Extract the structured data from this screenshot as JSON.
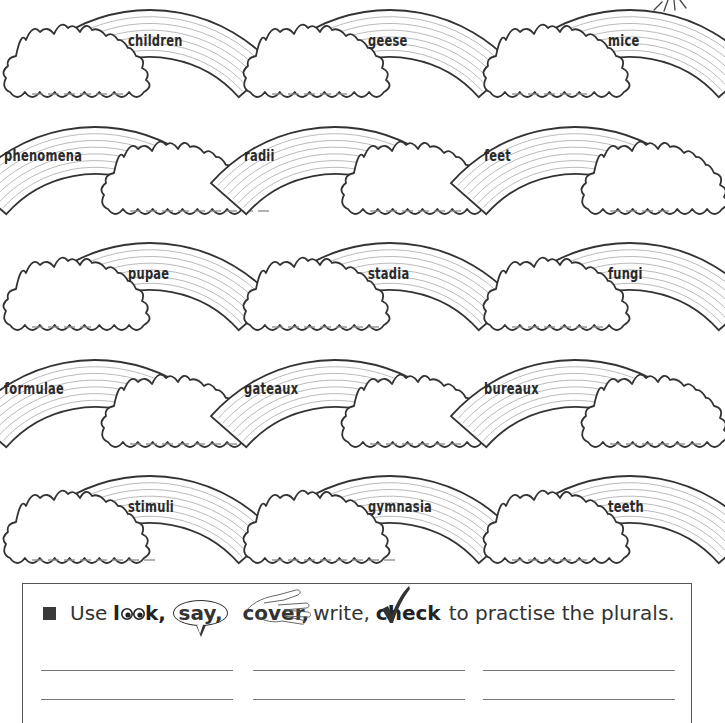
{
  "worksheet": {
    "plurals": [
      {
        "word": "children",
        "row": 0,
        "col": 0,
        "orientation": "cloud-left",
        "blanks": 6
      },
      {
        "word": "geese",
        "row": 0,
        "col": 1,
        "orientation": "cloud-left",
        "blanks": 5
      },
      {
        "word": "mice",
        "row": 0,
        "col": 2,
        "orientation": "cloud-left",
        "blanks": 5
      },
      {
        "word": "phenomena",
        "row": 1,
        "col": 0,
        "orientation": "cloud-right",
        "blanks": 9
      },
      {
        "word": "radii",
        "row": 1,
        "col": 1,
        "orientation": "cloud-right",
        "blanks": 6
      },
      {
        "word": "feet",
        "row": 1,
        "col": 2,
        "orientation": "cloud-right",
        "blanks": 4
      },
      {
        "word": "pupae",
        "row": 2,
        "col": 0,
        "orientation": "cloud-left",
        "blanks": 4
      },
      {
        "word": "stadia",
        "row": 2,
        "col": 1,
        "orientation": "cloud-left",
        "blanks": 7
      },
      {
        "word": "fungi",
        "row": 2,
        "col": 2,
        "orientation": "cloud-left",
        "blanks": 6
      },
      {
        "word": "formulae",
        "row": 3,
        "col": 0,
        "orientation": "cloud-right",
        "blanks": 7
      },
      {
        "word": "gateaux",
        "row": 3,
        "col": 1,
        "orientation": "cloud-right",
        "blanks": 6
      },
      {
        "word": "bureaux",
        "row": 3,
        "col": 2,
        "orientation": "cloud-right",
        "blanks": 6
      },
      {
        "word": "stimuli",
        "row": 4,
        "col": 0,
        "orientation": "cloud-left",
        "blanks": 8
      },
      {
        "word": "gymnasia",
        "row": 4,
        "col": 1,
        "orientation": "cloud-left",
        "blanks": 8
      },
      {
        "word": "teeth",
        "row": 4,
        "col": 2,
        "orientation": "cloud-left",
        "blanks": 5
      }
    ]
  },
  "instruction_box": {
    "prefix": "Use",
    "look": "look,",
    "say": "say,",
    "cover": "cover,",
    "write": "write,",
    "check": "check",
    "suffix": "to practise the plurals.",
    "writing_lines": {
      "rows": 2,
      "columns": 3
    }
  },
  "icons": {
    "bullet": "square-bullet-icon",
    "sun": "sun-rays-icon",
    "look": "eyes-icon",
    "say": "speech-bubble-icon",
    "cover": "hand-icon",
    "check": "tick-icon"
  },
  "colors": {
    "ink": "#333333",
    "rainbow_stripe": "#a8a8a8",
    "blank_dash": "#8a8a8a",
    "background": "#ffffff"
  }
}
